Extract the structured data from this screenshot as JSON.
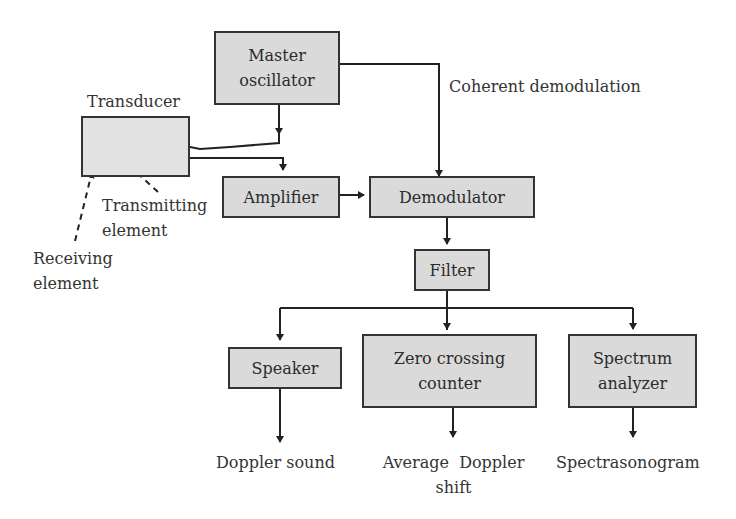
{
  "diagram": {
    "colors": {
      "box_fill": "#dadada",
      "stroke": "#333333",
      "text": "#2b2b2b"
    },
    "blocks": {
      "master_oscillator": "Master\noscillator",
      "amplifier": "Amplifier",
      "demodulator": "Demodulator",
      "filter": "Filter",
      "speaker": "Speaker",
      "zero_crossing_counter": "Zero crossing\ncounter",
      "spectrum_analyzer": "Spectrum\nanalyzer"
    },
    "labels": {
      "transducer": "Transducer",
      "coherent_demodulation": "Coherent demodulation",
      "transmitting_element": "Transmitting\nelement",
      "receiving_element": "Receiving\nelement",
      "doppler_sound": "Doppler sound",
      "average_doppler_shift": "Average  Doppler\nshift",
      "spectrasonogram": "Spectrasonogram"
    },
    "connections": [
      {
        "from": "Master oscillator",
        "to": "Transducer (transmitting element)"
      },
      {
        "from": "Master oscillator",
        "to": "Demodulator",
        "label": "Coherent demodulation"
      },
      {
        "from": "Transducer (receiving element)",
        "to": "Amplifier"
      },
      {
        "from": "Amplifier",
        "to": "Demodulator"
      },
      {
        "from": "Demodulator",
        "to": "Filter"
      },
      {
        "from": "Filter",
        "to": "Speaker"
      },
      {
        "from": "Filter",
        "to": "Zero crossing counter"
      },
      {
        "from": "Filter",
        "to": "Spectrum analyzer"
      },
      {
        "from": "Speaker",
        "to": "Doppler sound"
      },
      {
        "from": "Zero crossing counter",
        "to": "Average Doppler shift"
      },
      {
        "from": "Spectrum analyzer",
        "to": "Spectrasonogram"
      }
    ]
  }
}
